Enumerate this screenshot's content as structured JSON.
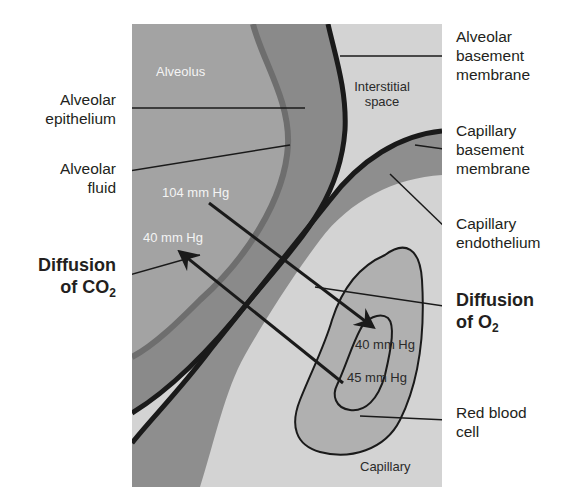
{
  "diagram": {
    "colors": {
      "alveolus": "#a3a3a3",
      "alveolar_fluid_line": "#6e6e6e",
      "alveolar_epithelium": "#8a8a8a",
      "membrane_line": "#1a1a1a",
      "interstitial_space": "#d3d3d3",
      "capillary_endothelium": "#8e8e8e",
      "capillary_lumen": "#d3d3d3",
      "red_blood_cell": "#b0b0b0",
      "label_text": "#231f20",
      "inner_white_text": "#f4f4f4"
    },
    "regions": {
      "alveolus": "Alveolus",
      "interstitial": [
        "Interstitial",
        "space"
      ],
      "capillary": "Capillary"
    },
    "pressures": {
      "alveolar_po2": "104 mm Hg",
      "alveolar_pco2": "40 mm Hg",
      "blood_po2": "40 mm Hg",
      "blood_pco2": "45 mm Hg"
    },
    "left_labels": {
      "alveolar_epithelium": [
        "Alveolar",
        "epithelium"
      ],
      "alveolar_fluid": [
        "Alveolar",
        "fluid"
      ],
      "diffusion_co2": {
        "line1": "Diffusion",
        "line2_prefix": "of CO",
        "sub": "2"
      }
    },
    "right_labels": {
      "alveolar_basement_membrane": [
        "Alveolar",
        "basement",
        "membrane"
      ],
      "capillary_basement_membrane": [
        "Capillary",
        "basement",
        "membrane"
      ],
      "capillary_endothelium": [
        "Capillary",
        "endothelium"
      ],
      "diffusion_o2": {
        "line1": "Diffusion",
        "line2_prefix": "of O",
        "sub": "2"
      },
      "red_blood_cell": [
        "Red blood",
        "cell"
      ]
    }
  }
}
